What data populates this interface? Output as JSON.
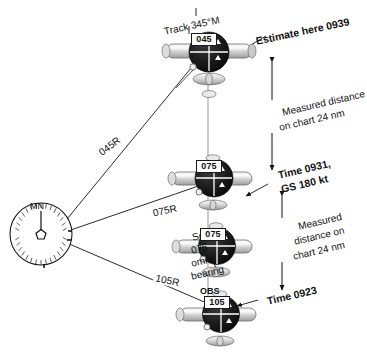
{
  "diagram": {
    "colors": {
      "ink": "#111111",
      "line": "#1a1a1a",
      "fuselage_light": "#e8e8e8",
      "fuselage_mid": "#b8b8b8",
      "indicator_dark": "#1b1b1b",
      "background": "#ffffff"
    }
  },
  "station": {
    "name": "vor-station",
    "north_label": "MN"
  },
  "track": {
    "label": "Track 345°M"
  },
  "radials": [
    {
      "name": "radial-045",
      "label": "045R"
    },
    {
      "name": "radial-075",
      "label": "075R"
    },
    {
      "name": "radial-105",
      "label": "105R"
    }
  ],
  "aircraft": [
    {
      "name": "aircraft-top",
      "obs": "045",
      "obs_prefix": "",
      "position_note": "estimate"
    },
    {
      "name": "aircraft-upper-middle",
      "obs": "075",
      "obs_prefix": "",
      "position_note": "fix 0931"
    },
    {
      "name": "aircraft-lower-middle",
      "obs": "075",
      "obs_prefix": "",
      "position_note": "select bearing"
    },
    {
      "name": "aircraft-bottom",
      "obs": "105",
      "obs_prefix": "OBS",
      "position_note": "fix 0923"
    }
  ],
  "annotations": {
    "estimate": "Estimate here 0939",
    "distance_upper_line1": "Measured distance",
    "distance_upper_line2": "on chart 24 nm",
    "time_0931_line1": "Time 0931,",
    "time_0931_line2": "GS 180 kt",
    "distance_lower_line1": "Measured",
    "distance_lower_line2": "distance on",
    "distance_lower_line3": "chart 24 nm",
    "time_0923": "Time 0923",
    "select_line1": "Select",
    "select_line2": "075",
    "select_line3": "omni",
    "select_line4": "bearing"
  }
}
